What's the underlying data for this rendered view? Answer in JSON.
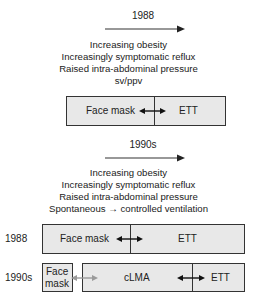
{
  "section_1988": {
    "title": "1988",
    "factors": [
      "Increasing obesity",
      "Increasingly symptomatic reflux",
      "Raised intra-abdominal pressure",
      "sv/ppv"
    ],
    "box": {
      "left": "Face mask",
      "right": "ETT"
    }
  },
  "section_1990s": {
    "title": "1990s",
    "factors": [
      "Increasing obesity",
      "Increasingly symptomatic reflux",
      "Raised intra-abdominal pressure",
      "Spontaneous → controlled ventilation"
    ]
  },
  "comparison": {
    "row_1988": {
      "label": "1988",
      "left": "Face mask",
      "right": "ETT"
    },
    "row_1990s": {
      "label": "1990s",
      "small_box": "Face mask",
      "small_box_line1": "Face",
      "small_box_line2": "mask",
      "middle": "cLMA",
      "right": "ETT"
    }
  },
  "colors": {
    "box_fill": "#e8e8e8",
    "border": "#333333",
    "arrow_dark": "#111111",
    "arrow_light": "#9a9a9a"
  }
}
